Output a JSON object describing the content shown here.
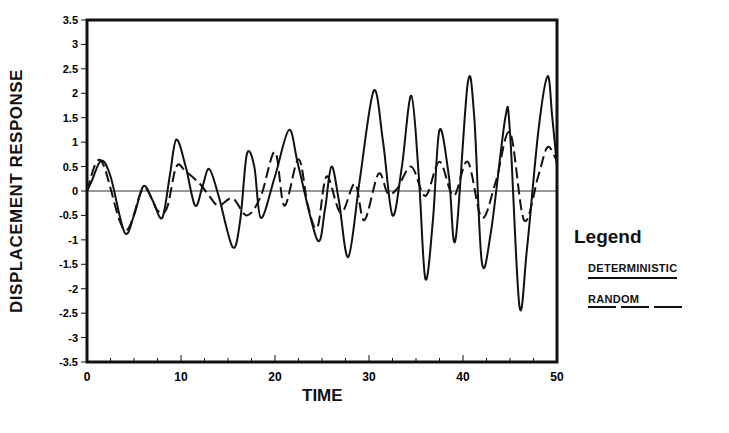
{
  "chart_data": {
    "type": "line",
    "title": "",
    "xlabel": "TIME",
    "ylabel": "DISPLACEMENT RESPONSE",
    "xlim": [
      0,
      50
    ],
    "ylim": [
      -3.5,
      3.5
    ],
    "x_ticks": [
      0,
      10,
      20,
      30,
      40,
      50
    ],
    "y_ticks": [
      3.5,
      3,
      2.5,
      2,
      1.5,
      1,
      0.5,
      0,
      -0.5,
      -1,
      -1.5,
      -2,
      -2.5,
      -3,
      -3.5
    ],
    "y_tick_labels": [
      "3.5",
      "3",
      "2.5",
      "2",
      "1.5",
      "1",
      "0.5",
      "0",
      "-0.5",
      "-1",
      "-1.5",
      "-2",
      "-2.5",
      "-3",
      "-3.5"
    ],
    "grid": false,
    "zero_line": true,
    "legend": {
      "title": "Legend",
      "position": "right",
      "entries": [
        {
          "label": "DETERMINISTIC",
          "style": "solid"
        },
        {
          "label": "RANDOM",
          "style": "dashed"
        }
      ]
    },
    "series": [
      {
        "name": "DETERMINISTIC",
        "style": "solid",
        "x": [
          0,
          0.5,
          1.5,
          2.5,
          4,
          5,
          6,
          7,
          8,
          8.8,
          9.5,
          10.5,
          11.5,
          12.3,
          13,
          14,
          15.5,
          16.3,
          17,
          17.8,
          18.5,
          20,
          21.5,
          22.5,
          24.5,
          25.3,
          26,
          26.8,
          27.8,
          29,
          30.5,
          31.5,
          32.5,
          33.5,
          34.5,
          35.3,
          36,
          36.8,
          37.5,
          38.5,
          39.2,
          40.5,
          41.2,
          42,
          43,
          44.5,
          45,
          46,
          46.8,
          48,
          49,
          49.5,
          50
        ],
        "values": [
          0,
          0.2,
          0.62,
          0.3,
          -0.85,
          -0.5,
          0.1,
          -0.2,
          -0.55,
          0.3,
          1.05,
          0.5,
          -0.3,
          0.1,
          0.45,
          -0.1,
          -1.15,
          -0.6,
          0.75,
          0.5,
          -0.55,
          0.3,
          1.25,
          0.5,
          -1.0,
          -0.4,
          0.5,
          -0.2,
          -1.35,
          0.2,
          2.05,
          1.0,
          -0.5,
          0.5,
          1.95,
          0.3,
          -1.8,
          -0.6,
          1.25,
          0.3,
          -1.0,
          2.2,
          1.5,
          -1.45,
          -0.8,
          1.5,
          1.2,
          -2.35,
          -1.2,
          1.2,
          2.35,
          1.5,
          0.5
        ]
      },
      {
        "name": "RANDOM",
        "style": "dashed",
        "x": [
          0,
          1.5,
          4,
          6,
          7.5,
          8.5,
          9.5,
          10.5,
          12,
          13,
          14,
          15.5,
          17,
          18.5,
          20,
          21,
          22.5,
          23.5,
          24.5,
          25.5,
          27,
          28.5,
          29.5,
          31,
          32,
          33,
          34.5,
          36,
          37.5,
          39,
          40.5,
          42,
          43.5,
          45,
          46.5,
          48,
          49,
          50
        ],
        "values": [
          0,
          0.62,
          -0.8,
          0.05,
          -0.4,
          -0.35,
          0.5,
          0.4,
          0.15,
          -0.1,
          -0.3,
          -0.15,
          -0.5,
          -0.1,
          0.8,
          -0.3,
          0.65,
          -0.3,
          -0.75,
          0.3,
          -0.45,
          0.15,
          -0.6,
          0.35,
          -0.05,
          0.05,
          0.5,
          -0.1,
          0.6,
          -0.1,
          0.6,
          -0.55,
          0.2,
          1.2,
          -0.6,
          0.3,
          0.9,
          0.6
        ]
      }
    ]
  }
}
